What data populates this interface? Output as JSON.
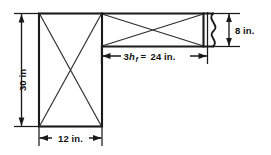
{
  "diagram": {
    "type": "engineering-cross-section-drawing",
    "units": "in.",
    "background_color": "#ffffff",
    "line_color": "#1a1a1a",
    "hatch_color": "#2b2b2b",
    "dimensions": {
      "web_depth": {
        "label": "30 in",
        "value": 30,
        "unit": "in",
        "orientation": "vertical",
        "position": "left"
      },
      "web_width": {
        "label": "12 in.",
        "value": 12,
        "unit": "in.",
        "orientation": "horizontal",
        "position": "bottom"
      },
      "flange_overhang": {
        "label_prefix": "3",
        "label_symbol": "h",
        "label_subscript": "f",
        "label_equals": "=",
        "label_value": "24 in.",
        "full_label": "3hf = 24 in.",
        "value": 24,
        "unit": "in.",
        "orientation": "horizontal",
        "position": "middle"
      },
      "flange_thickness": {
        "label": "8 in.",
        "value": 8,
        "unit": "in.",
        "orientation": "vertical",
        "position": "right"
      }
    },
    "shapes": {
      "web_rectangle": {
        "name": "web",
        "has_diagonal_cross": true
      },
      "flange_rectangle": {
        "name": "flange",
        "has_diagonal_cross": true
      },
      "break_symbol": {
        "name": "break-line",
        "style": "wavy-vertical"
      }
    }
  }
}
